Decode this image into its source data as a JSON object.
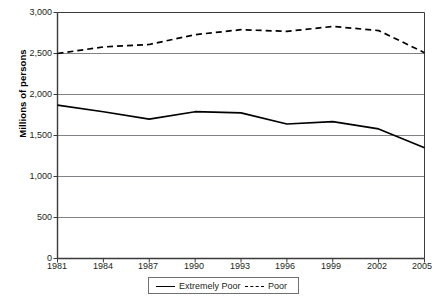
{
  "chart_data": {
    "type": "line",
    "title": "",
    "subtitle": "",
    "xlabel": "",
    "ylabel": "Millions of persons",
    "x": [
      1981,
      1984,
      1987,
      1990,
      1993,
      1996,
      1999,
      2002,
      2005
    ],
    "xlim": [
      1981,
      2005
    ],
    "ylim": [
      0,
      3000
    ],
    "ytick_labels": [
      "0",
      "500",
      "1,000",
      "1,500",
      "2,000",
      "2,500",
      "3,000"
    ],
    "ytick_values": [
      0,
      500,
      1000,
      1500,
      2000,
      2500,
      3000
    ],
    "xtick_labels": [
      "1981",
      "1984",
      "1987",
      "1990",
      "1993",
      "1996",
      "1999",
      "2002",
      "2005"
    ],
    "grid": "horizontal",
    "legend_position": "bottom-center",
    "series": [
      {
        "name": "Extremely Poor",
        "style": "solid",
        "color": "#000000",
        "values": [
          1870,
          1790,
          1700,
          1790,
          1775,
          1640,
          1670,
          1580,
          1350
        ]
      },
      {
        "name": "Poor",
        "style": "dashed",
        "color": "#000000",
        "values": [
          2500,
          2580,
          2610,
          2730,
          2790,
          2770,
          2830,
          2780,
          2510
        ]
      }
    ]
  },
  "legend": {
    "items": [
      {
        "label": "Extremely Poor",
        "style": "solid"
      },
      {
        "label": "Poor",
        "style": "dashed"
      }
    ]
  },
  "colors": {
    "axis": "#3b3b3b",
    "grid": "#808285",
    "line": "#000000",
    "text": "#231f20"
  }
}
